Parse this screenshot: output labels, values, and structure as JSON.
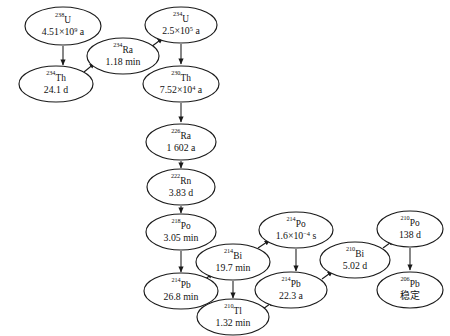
{
  "diagram": {
    "stable_label": "稳定",
    "nodes": [
      {
        "id": "u238",
        "mass": "238",
        "symbol": "U",
        "value_pre": "4.51×10",
        "value_exp": "9",
        "value_post": " a",
        "cx": 63,
        "cy": 26,
        "rx": 38,
        "ry": 19
      },
      {
        "id": "u234",
        "mass": "234",
        "symbol": "U",
        "value_pre": "2.5×10",
        "value_exp": "5",
        "value_post": " a",
        "cx": 181,
        "cy": 25,
        "rx": 36,
        "ry": 18
      },
      {
        "id": "ra234",
        "mass": "234",
        "symbol": "Ra",
        "value_pre": "1.18 min",
        "value_exp": "",
        "value_post": "",
        "cx": 123,
        "cy": 56,
        "rx": 36,
        "ry": 18
      },
      {
        "id": "th234",
        "mass": "234",
        "symbol": "Th",
        "value_pre": "24.1 d",
        "value_exp": "",
        "value_post": "",
        "cx": 56,
        "cy": 84,
        "rx": 37,
        "ry": 18
      },
      {
        "id": "th230",
        "mass": "230",
        "symbol": "Th",
        "value_pre": "7.52×10",
        "value_exp": "4",
        "value_post": " a",
        "cx": 181,
        "cy": 84,
        "rx": 38,
        "ry": 18
      },
      {
        "id": "ra226",
        "mass": "226",
        "symbol": "Ra",
        "value_pre": "1 602 a",
        "value_exp": "",
        "value_post": "",
        "cx": 181,
        "cy": 142,
        "rx": 35,
        "ry": 18
      },
      {
        "id": "rn222",
        "mass": "222",
        "symbol": "Rn",
        "value_pre": "3.83 d",
        "value_exp": "",
        "value_post": "",
        "cx": 181,
        "cy": 187,
        "rx": 34,
        "ry": 18
      },
      {
        "id": "po218",
        "mass": "218",
        "symbol": "Po",
        "value_pre": "3.05 min",
        "value_exp": "",
        "value_post": "",
        "cx": 181,
        "cy": 232,
        "rx": 35,
        "ry": 18
      },
      {
        "id": "bi214",
        "mass": "214",
        "symbol": "Bi",
        "value_pre": "19.7 min",
        "value_exp": "",
        "value_post": "",
        "cx": 233,
        "cy": 262,
        "rx": 37,
        "ry": 18
      },
      {
        "id": "po214",
        "mass": "214",
        "symbol": "Po",
        "value_pre": "1.6×10",
        "value_exp": "−4",
        "value_post": " s",
        "cx": 296,
        "cy": 230,
        "rx": 37,
        "ry": 18
      },
      {
        "id": "pb214",
        "mass": "214",
        "symbol": "Pb",
        "value_pre": "26.8 min",
        "value_exp": "",
        "value_post": "",
        "cx": 181,
        "cy": 291,
        "rx": 37,
        "ry": 18
      },
      {
        "id": "tl210",
        "mass": "210",
        "symbol": "Tl",
        "value_pre": "1.32 min",
        "value_exp": "",
        "value_post": "",
        "cx": 233,
        "cy": 317,
        "rx": 36,
        "ry": 18
      },
      {
        "id": "pb210",
        "mass": "214",
        "symbol": "Pb",
        "value_pre": "22.3 a",
        "value_exp": "",
        "value_post": "",
        "cx": 291,
        "cy": 290,
        "rx": 36,
        "ry": 18
      },
      {
        "id": "bi210",
        "mass": "210",
        "symbol": "Bi",
        "value_pre": "5.02 d",
        "value_exp": "",
        "value_post": "",
        "cx": 355,
        "cy": 260,
        "rx": 35,
        "ry": 18
      },
      {
        "id": "po210",
        "mass": "210",
        "symbol": "Po",
        "value_pre": "138 d",
        "value_exp": "",
        "value_post": "",
        "cx": 410,
        "cy": 229,
        "rx": 33,
        "ry": 18
      },
      {
        "id": "pb206",
        "mass": "206",
        "symbol": "Pb",
        "value_pre": "稳定",
        "value_exp": "",
        "value_post": "",
        "cx": 410,
        "cy": 290,
        "rx": 33,
        "ry": 18,
        "cjk": true
      }
    ],
    "edges": [
      {
        "id": "u238-th234",
        "from": "238U",
        "to": "234Th",
        "path": "M 63,46 L 63,65",
        "arrow": "down"
      },
      {
        "id": "th234-ra234",
        "from": "234Th",
        "to": "234Ra",
        "path": "M 84,72 L 95,63",
        "arrow": "upright"
      },
      {
        "id": "ra234-u234",
        "from": "234Ra",
        "to": "234U",
        "path": "M 151,47 L 163,38",
        "arrow": "upright"
      },
      {
        "id": "u234-th230",
        "from": "234U",
        "to": "230Th",
        "path": "M 181,44 L 181,64",
        "arrow": "down"
      },
      {
        "id": "th230-ra226",
        "from": "230Th",
        "to": "226Ra",
        "path": "M 181,103 L 181,122",
        "arrow": "down"
      },
      {
        "id": "ra226-rn222",
        "from": "226Ra",
        "to": "222Rn",
        "path": "M 181,161 L 181,168",
        "arrow": "down"
      },
      {
        "id": "rn222-po218",
        "from": "222Rn",
        "to": "218Po",
        "path": "M 181,206 L 181,213",
        "arrow": "down"
      },
      {
        "id": "po218-pb214",
        "from": "218Po",
        "to": "214Pb",
        "path": "M 181,251 L 181,272",
        "arrow": "down"
      },
      {
        "id": "pb214-bi214",
        "from": "214Pb",
        "to": "214Bi",
        "path": "M 203,281 L 213,273",
        "arrow": "upright"
      },
      {
        "id": "bi214-po214",
        "from": "214Bi",
        "to": "214Po",
        "path": "M 258,248 L 270,240",
        "arrow": "upright"
      },
      {
        "id": "bi214-tl210",
        "from": "214Bi",
        "to": "210Tl",
        "path": "M 233,281 L 233,298",
        "arrow": "down"
      },
      {
        "id": "po214-pb210",
        "from": "214Po",
        "to": "214Pb2",
        "path": "M 296,249 L 296,271",
        "arrow": "down"
      },
      {
        "id": "tl210-pb210",
        "from": "210Tl",
        "to": "214Pb2",
        "path": "M 263,309 L 274,301",
        "arrow": "upright"
      },
      {
        "id": "pb210-bi210",
        "from": "214Pb2",
        "to": "210Bi",
        "path": "M 322,279 L 333,271",
        "arrow": "upright"
      },
      {
        "id": "bi210-po210",
        "from": "210Bi",
        "to": "210Po",
        "path": "M 383,248 L 394,240",
        "arrow": "upright"
      },
      {
        "id": "po210-pb206",
        "from": "210Po",
        "to": "206Pb",
        "path": "M 410,248 L 410,270",
        "arrow": "down"
      }
    ]
  }
}
